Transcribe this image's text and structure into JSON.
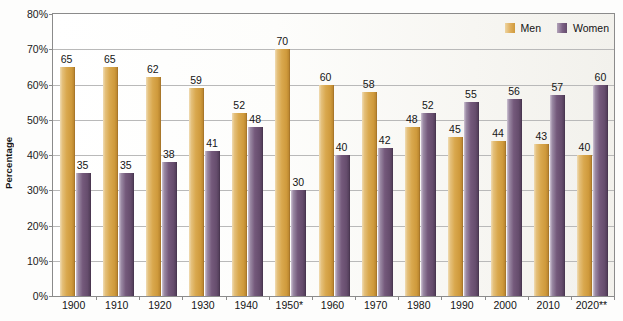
{
  "chart_data": {
    "type": "bar",
    "title": "",
    "xlabel": "",
    "ylabel": "Percentage",
    "ylim": [
      0,
      80
    ],
    "ytick_labels": [
      "0%",
      "10%",
      "20%",
      "30%",
      "40%",
      "50%",
      "60%",
      "70%",
      "80%"
    ],
    "ytick_values": [
      0,
      10,
      20,
      30,
      40,
      50,
      60,
      70,
      80
    ],
    "grid": true,
    "legend_position": "top-right",
    "categories": [
      "1900",
      "1910",
      "1920",
      "1930",
      "1940",
      "1950*",
      "1960",
      "1970",
      "1980",
      "1990",
      "2000",
      "2010",
      "2020**"
    ],
    "series": [
      {
        "name": "Men",
        "color": "#d9a84e",
        "values": [
          65,
          65,
          62,
          59,
          52,
          70,
          60,
          58,
          48,
          45,
          44,
          43,
          40
        ]
      },
      {
        "name": "Women",
        "color": "#74597b",
        "values": [
          35,
          35,
          38,
          41,
          48,
          30,
          40,
          42,
          52,
          55,
          56,
          57,
          60
        ]
      }
    ]
  },
  "legend": {
    "entries": [
      {
        "label": "Men",
        "swatch": "men-color-swatch"
      },
      {
        "label": "Women",
        "swatch": "women-color-swatch"
      }
    ]
  },
  "axis": {
    "y_title": "Percentage"
  }
}
